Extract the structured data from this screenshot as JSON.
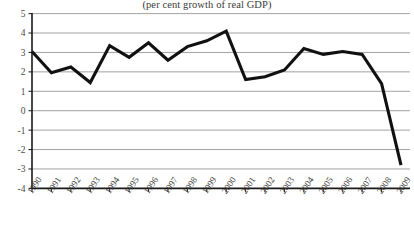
{
  "chart_data": {
    "type": "line",
    "title": "(per cent growth of real GDP)",
    "xlabel": "",
    "ylabel": "",
    "ylim": [
      -4,
      5
    ],
    "xlim": [
      1990,
      2009
    ],
    "grid": true,
    "legend": "none",
    "yticks": [
      5,
      4,
      3,
      2,
      1,
      0,
      -1,
      -2,
      -3,
      -4
    ],
    "ytick_labels": [
      "5",
      "4",
      "3",
      "2",
      "1",
      "0",
      "-1",
      "-2",
      "-3",
      "-4"
    ],
    "categories": [
      "1990",
      "1991",
      "1992",
      "1993",
      "1994",
      "1995",
      "1996",
      "1997",
      "1998",
      "1999",
      "2000",
      "2001",
      "2002",
      "2003",
      "2004",
      "2005",
      "2006",
      "2007",
      "2008",
      "2009"
    ],
    "series": [
      {
        "name": "Real GDP growth",
        "values": [
          3.05,
          1.95,
          2.25,
          1.45,
          3.35,
          2.75,
          3.5,
          2.6,
          3.3,
          3.6,
          4.1,
          1.6,
          1.75,
          2.1,
          3.2,
          2.9,
          3.05,
          2.9,
          1.4,
          -2.8
        ]
      }
    ]
  },
  "chart": {
    "title": "(per cent growth of real GDP)"
  }
}
